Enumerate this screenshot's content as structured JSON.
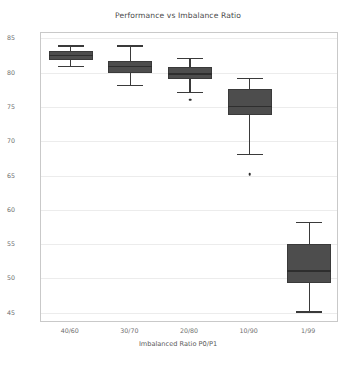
{
  "chart_data": {
    "type": "box",
    "title": "Performance vs Imbalance Ratio",
    "xlabel": "Imbalanced Ratio P0/P1",
    "ylabel": "Balanced Accuracy",
    "categories": [
      "40/60",
      "30/70",
      "20/80",
      "10/90",
      "1/99"
    ],
    "ylim": [
      43.5,
      85.8
    ],
    "yticks": [
      45,
      50,
      55,
      60,
      65,
      70,
      75,
      80,
      85
    ],
    "ytick_labels": [
      "45",
      "50",
      "55",
      "60",
      "65",
      "70",
      "75",
      "80",
      "85"
    ],
    "grid": true,
    "legend": "none",
    "boxes": [
      {
        "category": "40/60",
        "whisker_low": 81.0,
        "q1": 81.8,
        "median": 82.5,
        "q3": 83.2,
        "whisker_high": 84.0,
        "fliers": []
      },
      {
        "category": "30/70",
        "whisker_low": 78.2,
        "q1": 80.0,
        "median": 80.9,
        "q3": 81.7,
        "whisker_high": 84.0,
        "fliers": []
      },
      {
        "category": "20/80",
        "whisker_low": 77.2,
        "q1": 79.1,
        "median": 79.8,
        "q3": 80.9,
        "whisker_high": 82.2,
        "fliers": [
          76.1
        ]
      },
      {
        "category": "10/90",
        "whisker_low": 68.2,
        "q1": 73.8,
        "median": 75.1,
        "q3": 77.7,
        "whisker_high": 79.2,
        "fliers": [
          65.2
        ]
      },
      {
        "category": "1/99",
        "whisker_low": 45.2,
        "q1": 49.4,
        "median": 51.1,
        "q3": 55.0,
        "whisker_high": 58.2,
        "fliers": []
      }
    ],
    "colors": {
      "box_fill": "#4d4d4d",
      "box_edge": "#3a3a3a",
      "median": "#2e2e2e",
      "grid": "#ececec",
      "axes_edge": "#c9c9c9",
      "text": "#4a4a4a",
      "background": "#ffffff"
    }
  }
}
